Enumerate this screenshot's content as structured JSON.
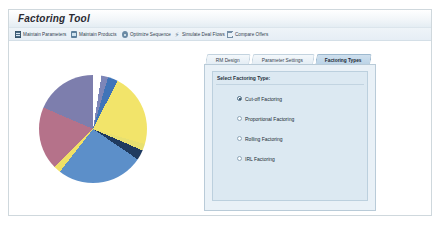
{
  "window": {
    "title": "Factoring Tool"
  },
  "toolbar": {
    "items": [
      {
        "label": "Maintain Parameters",
        "icon": "document-icon",
        "x": 6,
        "w": 52
      },
      {
        "label": "Maintain Products",
        "icon": "package-icon",
        "x": 62,
        "w": 47
      },
      {
        "label": "Optimize Sequence",
        "icon": "gear-icon",
        "x": 113,
        "w": 48
      },
      {
        "label": "Simulate Deal Flows",
        "icon": "bolt-icon",
        "x": 165,
        "w": 49
      },
      {
        "label": "Compare Offers",
        "icon": "chart-icon",
        "x": 218,
        "w": 44
      }
    ]
  },
  "tabs": [
    {
      "label": "RM Design",
      "x": 0,
      "w": 44,
      "active": false
    },
    {
      "label": "Parameter Settings",
      "x": 46,
      "w": 62,
      "active": false
    },
    {
      "label": "Factoring Types",
      "x": 110,
      "w": 55,
      "active": true
    }
  ],
  "panel": {
    "group_label": "Select Factoring Type:",
    "options": [
      {
        "label": "Cut-off Factoring",
        "selected": true
      },
      {
        "label": "Proportional Factoring",
        "selected": false
      },
      {
        "label": "Rolling Factoring",
        "selected": false
      },
      {
        "label": "IRL Factoring",
        "selected": false
      }
    ]
  },
  "chart_data": {
    "type": "pie",
    "title": "",
    "legend": "none",
    "categories": [
      "Segment A",
      "Segment B",
      "Segment C",
      "Segment D",
      "Segment E",
      "Segment F",
      "Segment G",
      "Segment H",
      "Segment I",
      "Segment J"
    ],
    "values": [
      2.5,
      2.0,
      3.0,
      22.0,
      2.0,
      3.0,
      26.0,
      2.0,
      19.0,
      18.5
    ],
    "colors": [
      "#ffffff",
      "#7d86b8",
      "#3f74b8",
      "#f2e46a",
      "#e8e070",
      "#1f3a5f",
      "#5c8fc9",
      "#f0e066",
      "#b5728a",
      "#7d7ead"
    ],
    "start_angle": 0,
    "units": "percent"
  }
}
